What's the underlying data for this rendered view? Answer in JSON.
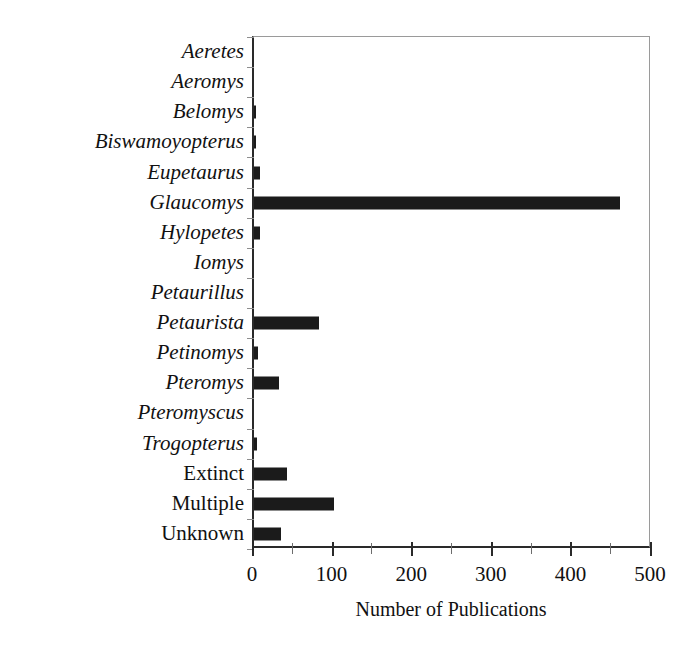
{
  "chart_data": {
    "type": "bar",
    "orientation": "horizontal",
    "title": "",
    "xlabel": "Number of Publications",
    "ylabel": "",
    "xlim": [
      0,
      500
    ],
    "xticks": [
      0,
      100,
      200,
      300,
      400,
      500
    ],
    "xtick_labels": [
      "0",
      "100",
      "200",
      "300",
      "400",
      "500"
    ],
    "minor_xticks": [
      50,
      150,
      250,
      350,
      450
    ],
    "grid": false,
    "legend": null,
    "bar_color": "#1b1b1b",
    "categories": [
      "Aeretes",
      "Aeromys",
      "Belomys",
      "Biswamoyopterus",
      "Eupetaurus",
      "Glaucomys",
      "Hylopetes",
      "Iomys",
      "Petaurillus",
      "Petaurista",
      "Petinomys",
      "Pteromys",
      "Pteromyscus",
      "Trogopterus",
      "Extinct",
      "Multiple",
      "Unknown"
    ],
    "category_styles": [
      "italic",
      "italic",
      "italic",
      "italic",
      "italic",
      "italic",
      "italic",
      "italic",
      "italic",
      "italic",
      "italic",
      "italic",
      "italic",
      "italic",
      "roman",
      "roman",
      "roman"
    ],
    "values": [
      0,
      0,
      3,
      3,
      8,
      460,
      8,
      0,
      0,
      82,
      5,
      31,
      0,
      4,
      42,
      100,
      34
    ]
  }
}
